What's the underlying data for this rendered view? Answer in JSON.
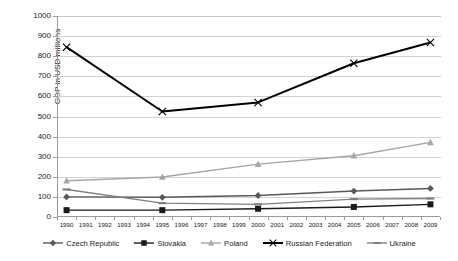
{
  "chart_data": {
    "type": "line",
    "title": "",
    "xlabel": "",
    "ylabel": "GDP in USD millions",
    "ylim": [
      0,
      1000
    ],
    "ytick_step": 100,
    "yticks": [
      "1000",
      "900",
      "800",
      "700",
      "600",
      "500",
      "400",
      "300",
      "200",
      "100",
      "0"
    ],
    "categories": [
      "1990",
      "1991",
      "1992",
      "1993",
      "1994",
      "1995",
      "1996",
      "1997",
      "1998",
      "1999",
      "2000",
      "2001",
      "2002",
      "2003",
      "2004",
      "2005",
      "2006",
      "2007",
      "2008",
      "2009"
    ],
    "marker_years": [
      "1990",
      "1995",
      "2000",
      "2005",
      "2009"
    ],
    "grid": true,
    "legend_position": "bottom",
    "series": [
      {
        "name": "Czech Republic",
        "marker": "diamond",
        "color": "#595959",
        "x": [
          "1990",
          "1995",
          "2000",
          "2005",
          "2009"
        ],
        "values": [
          100,
          98,
          107,
          129,
          142
        ]
      },
      {
        "name": "Slovakia",
        "marker": "square",
        "color": "#1a1a1a",
        "x": [
          "1990",
          "1995",
          "2000",
          "2005",
          "2009"
        ],
        "values": [
          34,
          34,
          41,
          50,
          63
        ]
      },
      {
        "name": "Poland",
        "marker": "triangle",
        "color": "#a6a6a6",
        "x": [
          "1990",
          "1995",
          "2000",
          "2005",
          "2009"
        ],
        "values": [
          180,
          199,
          263,
          305,
          371
        ]
      },
      {
        "name": "Russian Federation",
        "marker": "cross",
        "color": "#000000",
        "x": [
          "1990",
          "1995",
          "2000",
          "2005",
          "2009"
        ],
        "values": [
          845,
          525,
          570,
          765,
          868
        ]
      },
      {
        "name": "Ukraine",
        "marker": "dash",
        "color": "#808080",
        "x": [
          "1990",
          "1995",
          "2000",
          "2005",
          "2009"
        ],
        "values": [
          137,
          69,
          63,
          89,
          92
        ]
      }
    ]
  },
  "legend": {
    "items": [
      {
        "label": "Czech Republic"
      },
      {
        "label": "Slovakia"
      },
      {
        "label": "Poland"
      },
      {
        "label": "Russian Federation"
      },
      {
        "label": "Ukraine"
      }
    ]
  }
}
